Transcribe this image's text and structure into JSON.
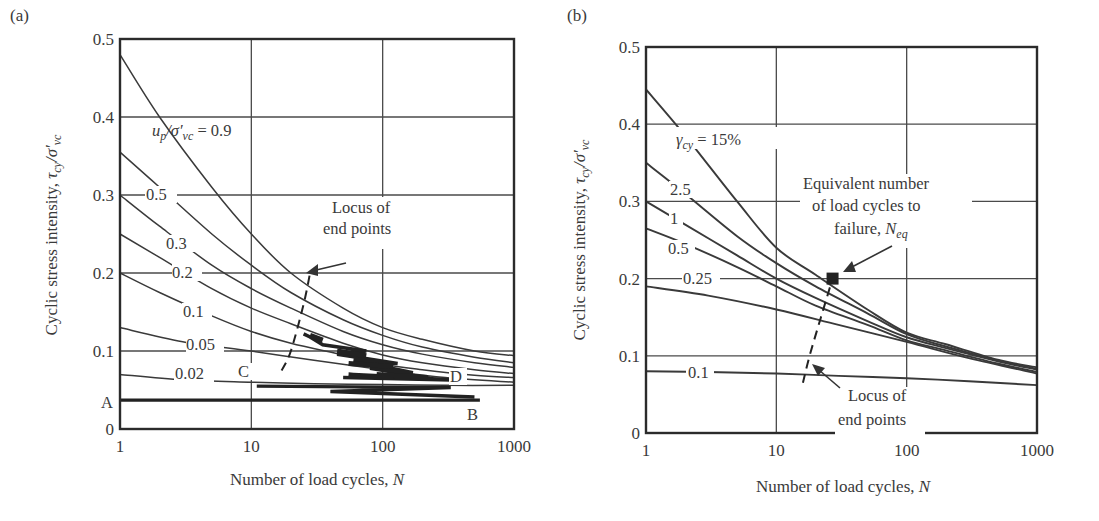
{
  "figure": {
    "panels": [
      {
        "id": "a",
        "label": "(a)"
      },
      {
        "id": "b",
        "label": "(b)"
      }
    ]
  },
  "chart_data": [
    {
      "panel": "(a)",
      "type": "line",
      "title": "",
      "xlabel": "Number of load cycles, N",
      "ylabel": "Cyclic stress intensity, τcy/σ′vc",
      "xscale": "log",
      "xlim": [
        1,
        1000
      ],
      "ylim": [
        0,
        0.5
      ],
      "xticks": [
        "1",
        "10",
        "100",
        "1000"
      ],
      "yticks": [
        "0",
        "0.1",
        "0.2",
        "0.3",
        "0.4",
        "0.5"
      ],
      "grid": true,
      "series_parameter": "up/σ′vc",
      "series": [
        {
          "name": "0.9",
          "label": "u_p/σ′_vc = 0.9",
          "x": [
            1,
            2,
            5,
            10,
            20,
            50,
            100,
            200,
            500,
            1000
          ],
          "values": [
            0.48,
            0.4,
            0.31,
            0.25,
            0.2,
            0.155,
            0.13,
            0.115,
            0.1,
            0.094
          ]
        },
        {
          "name": "0.5",
          "label": "0.5",
          "x": [
            1,
            2,
            5,
            10,
            20,
            50,
            100,
            200,
            500,
            1000
          ],
          "values": [
            0.355,
            0.31,
            0.25,
            0.21,
            0.175,
            0.14,
            0.12,
            0.105,
            0.092,
            0.085
          ]
        },
        {
          "name": "0.3",
          "label": "0.3",
          "x": [
            1,
            2,
            5,
            10,
            20,
            50,
            100,
            200,
            500,
            1000
          ],
          "values": [
            0.3,
            0.26,
            0.21,
            0.18,
            0.155,
            0.125,
            0.108,
            0.096,
            0.085,
            0.079
          ]
        },
        {
          "name": "0.2",
          "label": "0.2",
          "x": [
            1,
            2,
            5,
            10,
            20,
            50,
            100,
            200,
            500,
            1000
          ],
          "values": [
            0.25,
            0.22,
            0.18,
            0.155,
            0.135,
            0.11,
            0.095,
            0.085,
            0.076,
            0.071
          ]
        },
        {
          "name": "0.1",
          "label": "0.1",
          "x": [
            1,
            2,
            5,
            10,
            20,
            50,
            100,
            200,
            500,
            1000
          ],
          "values": [
            0.2,
            0.175,
            0.145,
            0.125,
            0.11,
            0.095,
            0.083,
            0.076,
            0.069,
            0.066
          ]
        },
        {
          "name": "0.05",
          "label": "0.05",
          "x": [
            1,
            3,
            10,
            30,
            100,
            300,
            1000
          ],
          "values": [
            0.13,
            0.112,
            0.1,
            0.088,
            0.076,
            0.066,
            0.06
          ]
        },
        {
          "name": "0.02",
          "label": "0.02",
          "x": [
            1,
            3,
            10,
            30,
            100,
            300,
            1000
          ],
          "values": [
            0.07,
            0.063,
            0.06,
            0.058,
            0.057,
            0.056,
            0.056
          ]
        }
      ],
      "load_path": {
        "description": "Stepped loading path from A to B, then C to D",
        "A": {
          "N": 1,
          "value": 0.037
        },
        "B": {
          "N": 550,
          "value": 0.037
        },
        "C": {
          "N": 11,
          "value": 0.055
        },
        "D": {
          "N": 220,
          "value": 0.062
        }
      },
      "locus": {
        "label": "Locus of end points",
        "x": [
          17,
          20,
          25,
          28
        ],
        "values": [
          0.075,
          0.1,
          0.16,
          0.2
        ]
      },
      "annotations": [
        "u_p/σ′_vc = 0.9",
        "Locus of end points",
        "A",
        "B",
        "C",
        "D"
      ]
    },
    {
      "panel": "(b)",
      "type": "line",
      "title": "",
      "xlabel": "Number of load cycles, N",
      "ylabel": "Cyclic stress intensity, τcy/σ′vc",
      "xscale": "log",
      "xlim": [
        1,
        1000
      ],
      "ylim": [
        0,
        0.5
      ],
      "xticks": [
        "1",
        "10",
        "100",
        "1000"
      ],
      "yticks": [
        "0",
        "0.1",
        "0.2",
        "0.3",
        "0.4",
        "0.5"
      ],
      "grid": true,
      "series_parameter": "γcy",
      "series": [
        {
          "name": "15%",
          "label": "γcy = 15%",
          "x": [
            1,
            2,
            5,
            10,
            20,
            50,
            100,
            200,
            500,
            1000
          ],
          "values": [
            0.445,
            0.385,
            0.3,
            0.24,
            0.205,
            0.16,
            0.13,
            0.115,
            0.095,
            0.085
          ]
        },
        {
          "name": "2.5",
          "label": "2.5",
          "x": [
            1,
            2,
            5,
            10,
            20,
            50,
            100,
            200,
            500,
            1000
          ],
          "values": [
            0.35,
            0.31,
            0.255,
            0.22,
            0.19,
            0.155,
            0.128,
            0.112,
            0.094,
            0.083
          ]
        },
        {
          "name": "1",
          "label": "1",
          "x": [
            1,
            2,
            5,
            10,
            20,
            50,
            100,
            200,
            500,
            1000
          ],
          "values": [
            0.3,
            0.27,
            0.23,
            0.2,
            0.175,
            0.145,
            0.124,
            0.11,
            0.093,
            0.082
          ]
        },
        {
          "name": "0.5",
          "label": "0.5",
          "x": [
            1,
            2,
            5,
            10,
            20,
            50,
            100,
            200,
            500,
            1000
          ],
          "values": [
            0.265,
            0.245,
            0.215,
            0.19,
            0.165,
            0.14,
            0.12,
            0.107,
            0.09,
            0.079
          ]
        },
        {
          "name": "0.25",
          "label": "0.25",
          "x": [
            1,
            3,
            10,
            30,
            100,
            300,
            1000
          ],
          "values": [
            0.19,
            0.178,
            0.16,
            0.14,
            0.118,
            0.097,
            0.077
          ]
        },
        {
          "name": "0.1",
          "label": "0.1",
          "x": [
            1,
            3,
            10,
            30,
            100,
            300,
            1000
          ],
          "values": [
            0.08,
            0.079,
            0.077,
            0.074,
            0.071,
            0.067,
            0.062
          ]
        }
      ],
      "equivalent_point": {
        "label": "Equivalent number of load cycles to failure, Neq",
        "N": 27,
        "value": 0.2
      },
      "locus": {
        "label": "Locus of end points",
        "x": [
          16,
          18,
          22,
          27
        ],
        "values": [
          0.065,
          0.1,
          0.15,
          0.2
        ]
      },
      "annotations": [
        "γcy = 15%",
        "Equivalent number of load cycles to failure, Neq",
        "Locus of end points"
      ]
    }
  ],
  "text": {
    "a": {
      "panel_label": "(a)",
      "ylabel_main": "Cyclic stress intensity, ",
      "xlabel_main": "Number of load cycles, ",
      "xlabel_var": "N",
      "curve_title_u": "u",
      "curve_title_p": "p",
      "curve_title_rest": "/σ′",
      "curve_title_vc": "vc",
      "curve_title_eq": " = 0.9",
      "locus_line1": "Locus of",
      "locus_line2": "end points",
      "point_A": "A",
      "point_B": "B",
      "point_C": "C",
      "point_D": "D",
      "labels": [
        "0.5",
        "0.3",
        "0.2",
        "0.1",
        "0.05",
        "0.02"
      ]
    },
    "b": {
      "panel_label": "(b)",
      "curve_title": "γ",
      "curve_title_sub": "cy",
      "curve_title_eq": " = 15%",
      "eq_line1": "Equivalent number",
      "eq_line2": "of load cycles to",
      "eq_line3": "failure, ",
      "eq_var": "N",
      "eq_sub": "eq",
      "locus_line1": "Locus of",
      "locus_line2": "end points",
      "labels": [
        "2.5",
        "1",
        "0.5",
        "0.25",
        "0.1"
      ]
    },
    "ticks_y": [
      "0",
      "0.1",
      "0.2",
      "0.3",
      "0.4",
      "0.5"
    ],
    "ticks_x": [
      "1",
      "10",
      "100",
      "1000"
    ],
    "tau": "τ",
    "tau_sub": "cy",
    "sigma": "/σ′",
    "sigma_sub": "vc"
  },
  "colors": {
    "axis": "#2b2b2b",
    "grid": "#4a4a4a",
    "curve": "#3a3a3a",
    "path": "#222222",
    "background": "#ffffff"
  }
}
